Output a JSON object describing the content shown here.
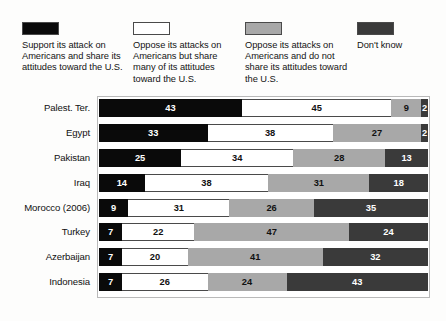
{
  "chart_data": {
    "type": "bar",
    "subtype": "stacked-horizontal-100",
    "title": "",
    "xlabel": "",
    "ylabel": "",
    "xlim": [
      0,
      100
    ],
    "grid": false,
    "legend_position": "top",
    "categories": [
      "Palest. Ter.",
      "Egypt",
      "Pakistan",
      "Iraq",
      "Morocco (2006)",
      "Turkey",
      "Azerbaijan",
      "Indonesia"
    ],
    "series": [
      {
        "name": "Support its attack on Americans and share its attitudes toward the U.S.",
        "color": "#0a0a0a",
        "values": [
          43,
          33,
          25,
          14,
          9,
          7,
          7,
          7
        ]
      },
      {
        "name": "Oppose its attacks on Americans but share many of its attitudes toward the U.S.",
        "color": "#ffffff",
        "values": [
          45,
          38,
          34,
          38,
          31,
          22,
          20,
          26
        ]
      },
      {
        "name": "Oppose its attacks on Americans and do not share its attitudes toward the U.S.",
        "color": "#a8a8a8",
        "values": [
          9,
          27,
          28,
          31,
          26,
          47,
          41,
          24
        ]
      },
      {
        "name": "Don't know",
        "color": "#3a3a3a",
        "values": [
          2,
          2,
          13,
          18,
          35,
          24,
          32,
          43
        ]
      }
    ]
  },
  "legend": {
    "items": [
      {
        "label": "Support its attack on Americans and share its attitudes toward the U.S.",
        "color": "#0a0a0a"
      },
      {
        "label": "Oppose its attacks on Americans but share many of its attitudes toward the U.S.",
        "color": "#ffffff"
      },
      {
        "label": "Oppose its attacks on Americans and do not share its attitudes toward the U.S.",
        "color": "#a8a8a8"
      },
      {
        "label": "Don't know",
        "color": "#3a3a3a"
      }
    ]
  },
  "rows": [
    {
      "label": "Palest. Ter.",
      "values": [
        43,
        45,
        9,
        2
      ]
    },
    {
      "label": "Egypt",
      "values": [
        33,
        38,
        27,
        2
      ]
    },
    {
      "label": "Pakistan",
      "values": [
        25,
        34,
        28,
        13
      ]
    },
    {
      "label": "Iraq",
      "values": [
        14,
        38,
        31,
        18
      ]
    },
    {
      "label": "Morocco (2006)",
      "values": [
        9,
        31,
        26,
        35
      ]
    },
    {
      "label": "Turkey",
      "values": [
        7,
        22,
        47,
        24
      ]
    },
    {
      "label": "Azerbaijan",
      "values": [
        7,
        20,
        41,
        32
      ]
    },
    {
      "label": "Indonesia",
      "values": [
        7,
        26,
        24,
        43
      ]
    }
  ]
}
